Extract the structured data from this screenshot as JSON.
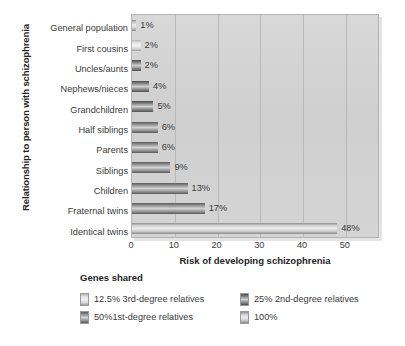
{
  "chart_data": {
    "type": "bar",
    "orientation": "horizontal",
    "title": "",
    "xlabel": "Risk of developing schizophrenia",
    "ylabel": "Relationship to person with schizophrenia",
    "xlim": [
      0,
      58
    ],
    "xticks": [
      0,
      10,
      20,
      30,
      40,
      50
    ],
    "grid": true,
    "legend_position": "bottom",
    "categories": [
      "General population",
      "First cousins",
      "Uncles/aunts",
      "Nephews/nieces",
      "Grandchildren",
      "Half siblings",
      "Parents",
      "Siblings",
      "Children",
      "Fraternal twins",
      "Identical twins"
    ],
    "values": [
      1,
      2,
      2,
      4,
      5,
      6,
      6,
      9,
      13,
      17,
      48
    ],
    "value_labels": [
      "1%",
      "2%",
      "2%",
      "4%",
      "5%",
      "6%",
      "6%",
      "9%",
      "13%",
      "17%",
      "48%"
    ],
    "group_keys": [
      "g100",
      "g125",
      "g25",
      "g25",
      "g25",
      "g50",
      "g50",
      "g50",
      "g50",
      "g50",
      "g100"
    ],
    "legend": {
      "title": "Genes shared",
      "entries": [
        {
          "key": "g125",
          "label": "12.5% 3rd-degree relatives"
        },
        {
          "key": "g25",
          "label": "25% 2nd-degree relatives"
        },
        {
          "key": "g50",
          "label": "50%1st-degree relatives"
        },
        {
          "key": "g100",
          "label": "100%"
        }
      ]
    },
    "colors": {
      "plot_background": "#d2d2d2",
      "gridline": "#b9b9b9",
      "text": "#3a3a3a",
      "bar_12_5": "#e9e9e9",
      "bar_25": "#6a6a6a",
      "bar_50": "#8f8f8f",
      "bar_100": "#d5d5d5"
    }
  }
}
